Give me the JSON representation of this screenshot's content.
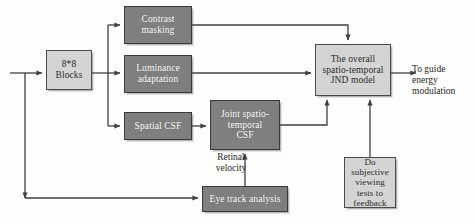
{
  "diagram": {
    "colors": {
      "dark_block": "#7f7f7f",
      "light_block": "#d4d4d4",
      "wire": "#3f3f3f",
      "background": "#fdfdfc"
    },
    "nodes": [
      {
        "id": "blocks",
        "label": "8*8\nBlocks",
        "style": "light",
        "x": 46,
        "y": 50,
        "w": 46,
        "h": 40,
        "font_size": 9.5
      },
      {
        "id": "contrast-masking",
        "label": "Contrast\nmasking",
        "style": "dark",
        "x": 124,
        "y": 6,
        "w": 68,
        "h": 38,
        "font_size": 9.5
      },
      {
        "id": "luminance-adaptation",
        "label": "Luminance\nadaptation",
        "style": "dark",
        "x": 124,
        "y": 55,
        "w": 68,
        "h": 38,
        "font_size": 9.5
      },
      {
        "id": "spatial-csf",
        "label": "Spatial CSF",
        "style": "dark",
        "x": 124,
        "y": 112,
        "w": 68,
        "h": 28,
        "font_size": 9.5
      },
      {
        "id": "joint-spatio-temporal-csf",
        "label": "Joint spatio-\ntemporal\nCSF",
        "style": "dark",
        "x": 210,
        "y": 100,
        "w": 70,
        "h": 50,
        "font_size": 9.5
      },
      {
        "id": "overall-jnd-model",
        "label": "The overall\nspatio-temporal\nJND model",
        "style": "light",
        "x": 315,
        "y": 44,
        "w": 76,
        "h": 52,
        "font_size": 9.5
      },
      {
        "id": "eye-track-analysis",
        "label": "Eye track analysis",
        "style": "dark",
        "x": 202,
        "y": 186,
        "w": 86,
        "h": 26,
        "font_size": 9.5
      },
      {
        "id": "subjective-tests",
        "label": "Do subjective\nviewing\ntests to\nfeedback",
        "style": "light",
        "x": 344,
        "y": 157,
        "w": 52,
        "h": 51,
        "font_size": 9
      }
    ],
    "captions": [
      {
        "id": "retinal-velocity",
        "text": "Retinal\nvelocity",
        "x": 205,
        "y": 152,
        "w": 52,
        "font_size": 9.5,
        "align": "center"
      },
      {
        "id": "to-guide-energy-modulation",
        "text": "To guide\nenergy\nmodulation",
        "x": 412,
        "y": 64,
        "w": 62,
        "font_size": 9.5,
        "align": "left"
      }
    ],
    "wires": [
      {
        "id": "input-to-blocks",
        "d": "M 10 73 L 42 73",
        "arrow_end": true
      },
      {
        "id": "input-branch-down-to-eye-track",
        "d": "M 25 73 L 25 198",
        "arrow_end": true
      },
      {
        "id": "eye-track-feed",
        "d": "M 25 198 L 198 198",
        "arrow_end": true
      },
      {
        "id": "blocks-out-to-bus",
        "d": "M 92 73 L 120 73",
        "arrow_end": true
      },
      {
        "id": "bus-vertical",
        "d": "M 108 25 L 108 126",
        "arrow_end": false
      },
      {
        "id": "bus-to-contrast-masking",
        "d": "M 108 25 L 120 25",
        "arrow_end": true
      },
      {
        "id": "bus-to-spatial-csf",
        "d": "M 108 126 L 120 126",
        "arrow_end": true
      },
      {
        "id": "contrast-masking-to-jnd",
        "d": "M 192 25 L 348 25 L 348 40",
        "arrow_end": true
      },
      {
        "id": "luminance-to-jnd",
        "d": "M 192 73 L 311 73",
        "arrow_end": true
      },
      {
        "id": "spatial-csf-to-joint-csf",
        "d": "M 192 126 L 206 126",
        "arrow_end": true
      },
      {
        "id": "joint-csf-to-jnd",
        "d": "M 280 125 L 327 125 L 327 100",
        "arrow_end": true
      },
      {
        "id": "eye-track-to-joint-csf",
        "d": "M 245 186 L 245 154",
        "arrow_end": true
      },
      {
        "id": "subjective-to-jnd",
        "d": "M 370 157 L 370 100",
        "arrow_end": true
      },
      {
        "id": "jnd-output",
        "d": "M 391 73 L 416 73",
        "arrow_end": true
      }
    ]
  }
}
